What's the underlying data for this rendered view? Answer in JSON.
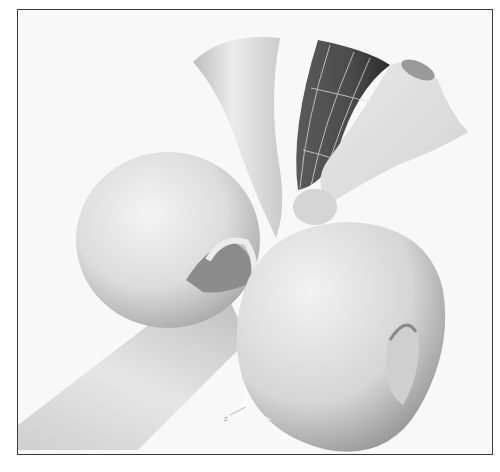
{
  "viewport": {
    "description": "3D modeling viewport showing rendered NURBS surfaces: a tube with a bulbous torus-like end, two flared horn shapes and a selected dark surface with isoparm grid lines",
    "background_color": "#f8f8f8",
    "border_color": "#3a3a3a",
    "surface_color": "#e2e2e2",
    "selected_surface_color": "#4a4a4a",
    "isoparm_color": "#d8d8d8",
    "axis_gizmo": {
      "labels": [
        "z"
      ]
    }
  }
}
